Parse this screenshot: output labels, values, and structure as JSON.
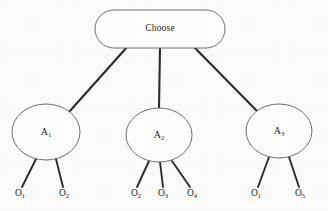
{
  "diagram": {
    "type": "decision-tree",
    "title": "Choose",
    "root": {
      "id": "root",
      "label": "Choose",
      "shape": "stadium",
      "cx": 160,
      "cy": 29,
      "rx": 65,
      "ry": 19
    },
    "actions": [
      {
        "id": "A1",
        "base": "A",
        "subscript": "1",
        "shape": "ellipse",
        "cx": 46,
        "cy": 132,
        "rx": 34,
        "ry": 28
      },
      {
        "id": "A2",
        "base": "A",
        "subscript": "2",
        "shape": "ellipse",
        "cx": 159,
        "cy": 135,
        "rx": 33,
        "ry": 27
      },
      {
        "id": "A3",
        "base": "A",
        "subscript": "3",
        "shape": "ellipse",
        "cx": 279,
        "cy": 131,
        "rx": 33,
        "ry": 27
      }
    ],
    "outcomes": [
      {
        "id": "L1",
        "base": "O",
        "subscript": "1",
        "parent": "A1",
        "x": 20,
        "y": 192,
        "edge_from_x": 36,
        "edge_from_y": 159,
        "edge_to_x": 22,
        "edge_to_y": 187
      },
      {
        "id": "L2",
        "base": "O",
        "subscript": "2",
        "parent": "A1",
        "x": 64,
        "y": 192,
        "edge_from_x": 56,
        "edge_from_y": 159,
        "edge_to_x": 63,
        "edge_to_y": 187
      },
      {
        "id": "L3",
        "base": "O",
        "subscript": "2",
        "parent": "A2",
        "x": 136,
        "y": 192,
        "edge_from_x": 149,
        "edge_from_y": 161,
        "edge_to_x": 137,
        "edge_to_y": 187
      },
      {
        "id": "L4",
        "base": "O",
        "subscript": "3",
        "parent": "A2",
        "x": 163,
        "y": 192,
        "edge_from_x": 160,
        "edge_from_y": 162,
        "edge_to_x": 163,
        "edge_to_y": 187
      },
      {
        "id": "L5",
        "base": "O",
        "subscript": "4",
        "parent": "A2",
        "x": 192,
        "y": 192,
        "edge_from_x": 172,
        "edge_from_y": 161,
        "edge_to_x": 190,
        "edge_to_y": 187
      },
      {
        "id": "L6",
        "base": "O",
        "subscript": "1",
        "parent": "A3",
        "x": 256,
        "y": 192,
        "edge_from_x": 269,
        "edge_from_y": 157,
        "edge_to_x": 258,
        "edge_to_y": 187
      },
      {
        "id": "L7",
        "base": "O",
        "subscript": "5",
        "parent": "A3",
        "x": 300,
        "y": 192,
        "edge_from_x": 289,
        "edge_from_y": 157,
        "edge_to_x": 299,
        "edge_to_y": 187
      }
    ],
    "branches": [
      {
        "id": "root-A1",
        "from": "root",
        "to": "A1",
        "x1": 128,
        "y1": 46,
        "x2": 69,
        "y2": 112
      },
      {
        "id": "root-A2",
        "from": "root",
        "to": "A2",
        "x1": 160,
        "y1": 48,
        "x2": 159,
        "y2": 108
      },
      {
        "id": "root-A3",
        "from": "root",
        "to": "A3",
        "x1": 193,
        "y1": 46,
        "x2": 257,
        "y2": 111
      }
    ],
    "colors": {
      "background": "#fbfbfa",
      "node_fill": "#fdfdfc",
      "node_stroke": "#6f6f6f",
      "edge": "#2b2b2b",
      "text": "#1d1d1d"
    }
  }
}
